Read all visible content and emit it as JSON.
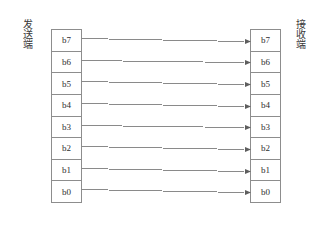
{
  "diagram": {
    "sender": {
      "label": "发送端",
      "bits": [
        "b7",
        "b6",
        "b5",
        "b4",
        "b3",
        "b2",
        "b1",
        "b0"
      ]
    },
    "receiver": {
      "label": "接收端",
      "bits": [
        "b7",
        "b6",
        "b5",
        "b4",
        "b3",
        "b2",
        "b1",
        "b0"
      ]
    },
    "connections": [
      {
        "from": "b7",
        "to": "b7",
        "direction": "sender-to-receiver"
      },
      {
        "from": "b6",
        "to": "b6",
        "direction": "sender-to-receiver"
      },
      {
        "from": "b5",
        "to": "b5",
        "direction": "sender-to-receiver"
      },
      {
        "from": "b4",
        "to": "b4",
        "direction": "sender-to-receiver"
      },
      {
        "from": "b3",
        "to": "b3",
        "direction": "sender-to-receiver"
      },
      {
        "from": "b2",
        "to": "b2",
        "direction": "sender-to-receiver"
      },
      {
        "from": "b1",
        "to": "b1",
        "direction": "sender-to-receiver"
      },
      {
        "from": "b0",
        "to": "b0",
        "direction": "sender-to-receiver"
      }
    ],
    "colors": {
      "line": "#8a8a8a",
      "arrowhead": "#5e5e5e",
      "cell_border": "#8d8d8d",
      "box_border": "#9a9a9a",
      "background": "#ffffff",
      "text": "#2e2e2e"
    }
  }
}
